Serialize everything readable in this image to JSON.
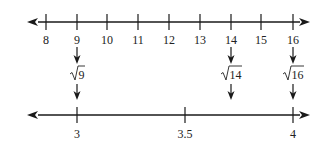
{
  "diagram": {
    "title": "",
    "colors": {
      "line": "#1a1a1a",
      "text": "#222222",
      "background": "#ffffff"
    },
    "top_line": {
      "ticks": [
        {
          "label": "8",
          "value": 8,
          "x": 46
        },
        {
          "label": "9",
          "value": 9,
          "x": 77
        },
        {
          "label": "10",
          "value": 10,
          "x": 107
        },
        {
          "label": "11",
          "value": 11,
          "x": 138
        },
        {
          "label": "12",
          "value": 12,
          "x": 169
        },
        {
          "label": "13",
          "value": 13,
          "x": 200
        },
        {
          "label": "14",
          "value": 14,
          "x": 231
        },
        {
          "label": "15",
          "value": 15,
          "x": 261
        },
        {
          "label": "16",
          "value": 16,
          "x": 293
        }
      ]
    },
    "mappings": [
      {
        "from": "9",
        "radicand": "9",
        "to": "3",
        "x": 77
      },
      {
        "from": "14",
        "radicand": "14",
        "to": "≈3.74",
        "x": 231
      },
      {
        "from": "16",
        "radicand": "16",
        "to": "4",
        "x": 293
      }
    ],
    "bottom_line": {
      "ticks": [
        {
          "label": "3",
          "value": 3,
          "x": 77
        },
        {
          "label": "3.5",
          "value": 3.5,
          "x": 185
        },
        {
          "label": "4",
          "value": 4,
          "x": 293
        }
      ]
    }
  }
}
